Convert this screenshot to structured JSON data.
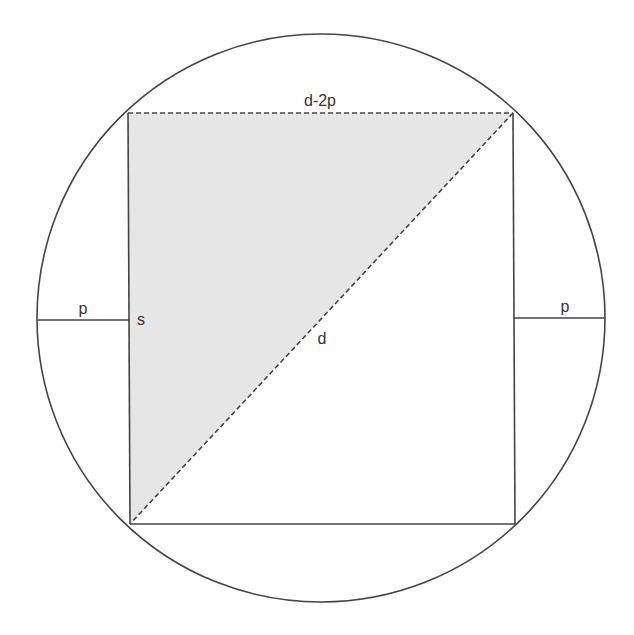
{
  "diagram": {
    "labels": {
      "top_edge": "d-2p",
      "left_gap": "p",
      "right_gap": "p",
      "side": "s",
      "diagonal": "d"
    },
    "colors": {
      "stroke": "#444444",
      "shade": "#e6e6e6",
      "background": "#ffffff"
    }
  }
}
